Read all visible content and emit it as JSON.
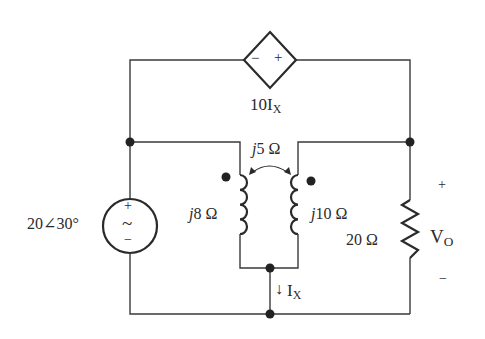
{
  "circuit": {
    "dependent_source": {
      "label_main": "10I",
      "label_sub": "X",
      "minus": "−",
      "plus": "+"
    },
    "voltage_source": {
      "label": "20∠30°",
      "plus": "+",
      "minus": "−",
      "symbol": "~"
    },
    "inductor_left": {
      "j": "j",
      "value": "8 Ω"
    },
    "inductor_right": {
      "j": "j",
      "value": "10 Ω"
    },
    "mutual": {
      "j": "j",
      "value": "5 Ω"
    },
    "resistor": {
      "label": "20 Ω"
    },
    "output_voltage": {
      "main": "V",
      "sub": "O",
      "plus": "+",
      "minus": "−"
    },
    "current": {
      "main": "I",
      "sub": "X",
      "arrow": "↓"
    }
  }
}
